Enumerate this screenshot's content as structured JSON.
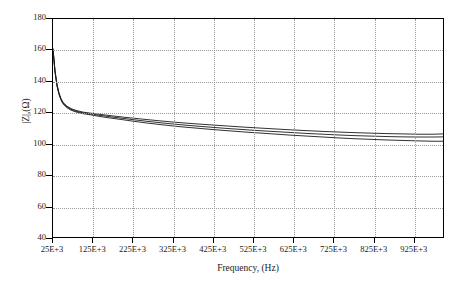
{
  "chart_data": {
    "type": "line",
    "title": "",
    "xlabel": "Frequency, (Hz)",
    "ylabel": "|Z|,(Ω)",
    "xlim": [
      25000,
      1000000
    ],
    "ylim": [
      40,
      180
    ],
    "grid": true,
    "legend": "none",
    "y_ticks": [
      40,
      60,
      80,
      100,
      120,
      140,
      160,
      180
    ],
    "x_ticks": [
      25000,
      125000,
      225000,
      325000,
      425000,
      525000,
      625000,
      725000,
      825000,
      925000
    ],
    "x_tick_labels": [
      "25E+3",
      "125E+3",
      "225E+3",
      "325E+3",
      "425E+3",
      "525E+3",
      "625E+3",
      "725E+3",
      "825E+3",
      "925E+3"
    ],
    "series": [
      {
        "name": "impedance-curve-upper",
        "color": "#1a1a1a",
        "x": [
          25000,
          30000,
          35000,
          40000,
          45000,
          50000,
          60000,
          70000,
          80000,
          90000,
          100000,
          120000,
          140000,
          160000,
          180000,
          200000,
          230000,
          260000,
          300000,
          340000,
          380000,
          420000,
          460000,
          500000,
          540000,
          580000,
          620000,
          660000,
          700000,
          740000,
          780000,
          820000,
          860000,
          900000,
          940000,
          975000,
          1000000
        ],
        "y": [
          161.0,
          147.0,
          138.0,
          132.5,
          129.0,
          126.5,
          124.0,
          122.5,
          121.5,
          120.8,
          120.2,
          119.5,
          118.8,
          118.2,
          117.6,
          117.0,
          116.2,
          115.4,
          114.4,
          113.5,
          112.7,
          112.0,
          111.3,
          110.6,
          110.0,
          109.4,
          108.8,
          108.3,
          107.8,
          107.4,
          107.0,
          106.7,
          106.4,
          106.2,
          106.0,
          106.0,
          106.2
        ]
      },
      {
        "name": "impedance-curve-middle",
        "color": "#1a1a1a",
        "x": [
          25000,
          30000,
          35000,
          40000,
          45000,
          50000,
          60000,
          70000,
          80000,
          90000,
          100000,
          120000,
          140000,
          160000,
          180000,
          200000,
          230000,
          260000,
          300000,
          340000,
          380000,
          420000,
          460000,
          500000,
          540000,
          580000,
          620000,
          660000,
          700000,
          740000,
          780000,
          820000,
          860000,
          900000,
          940000,
          975000,
          1000000
        ],
        "y": [
          160.5,
          146.5,
          137.5,
          132.0,
          128.5,
          126.0,
          123.5,
          122.0,
          121.0,
          120.3,
          119.7,
          119.0,
          118.2,
          117.5,
          116.8,
          116.2,
          115.2,
          114.3,
          113.2,
          112.2,
          111.3,
          110.5,
          109.7,
          109.0,
          108.3,
          107.7,
          107.1,
          106.5,
          106.0,
          105.5,
          105.1,
          104.8,
          104.5,
          104.3,
          104.2,
          104.2,
          104.3
        ]
      },
      {
        "name": "impedance-curve-lower",
        "color": "#1a1a1a",
        "x": [
          25000,
          30000,
          35000,
          40000,
          45000,
          50000,
          60000,
          70000,
          80000,
          90000,
          100000,
          120000,
          140000,
          160000,
          180000,
          200000,
          230000,
          260000,
          300000,
          340000,
          380000,
          420000,
          460000,
          500000,
          540000,
          580000,
          620000,
          660000,
          700000,
          740000,
          780000,
          820000,
          860000,
          900000,
          940000,
          975000,
          1000000
        ],
        "y": [
          160.0,
          146.0,
          137.0,
          131.5,
          128.0,
          125.5,
          123.0,
          121.5,
          120.5,
          119.8,
          119.2,
          118.4,
          117.5,
          116.7,
          116.0,
          115.3,
          114.2,
          113.2,
          112.0,
          110.9,
          110.0,
          109.1,
          108.3,
          107.5,
          106.8,
          106.1,
          105.4,
          104.8,
          104.2,
          103.6,
          103.1,
          102.7,
          102.3,
          102.0,
          101.7,
          101.5,
          101.5
        ]
      }
    ]
  }
}
